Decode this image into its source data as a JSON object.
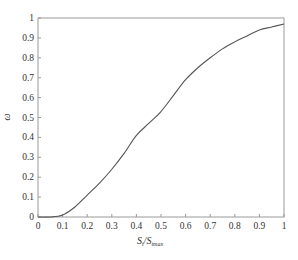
{
  "chart_data": {
    "type": "line",
    "title": "",
    "xlabel": "S_t/S_tmax",
    "xlabel_main": "S",
    "xlabel_sub1": "t",
    "xlabel_slash": "/S",
    "xlabel_sub2": "tmax",
    "ylabel": "ω",
    "xlim": [
      0,
      1
    ],
    "ylim": [
      0,
      1
    ],
    "grid": false,
    "legend": null,
    "x_ticks": [
      "0",
      "0.1",
      "0.2",
      "0.3",
      "0.4",
      "0.5",
      "0.6",
      "0.7",
      "0.8",
      "0.9",
      "1"
    ],
    "y_ticks": [
      "0",
      "0.1",
      "0.2",
      "0.3",
      "0.4",
      "0.5",
      "0.6",
      "0.7",
      "0.8",
      "0.9",
      "1"
    ],
    "series": [
      {
        "name": "ω",
        "color": "#555555",
        "x": [
          0,
          0.05,
          0.1,
          0.15,
          0.2,
          0.25,
          0.3,
          0.35,
          0.4,
          0.45,
          0.5,
          0.55,
          0.6,
          0.65,
          0.7,
          0.75,
          0.8,
          0.85,
          0.9,
          0.95,
          1.0
        ],
        "y": [
          0,
          0.0,
          0.01,
          0.05,
          0.11,
          0.17,
          0.24,
          0.32,
          0.41,
          0.47,
          0.53,
          0.61,
          0.69,
          0.75,
          0.8,
          0.845,
          0.88,
          0.91,
          0.94,
          0.955,
          0.97
        ]
      }
    ]
  },
  "colors": {
    "axis": "#9a9a9a",
    "line": "#555555",
    "text": "#333333",
    "background": "#ffffff"
  }
}
